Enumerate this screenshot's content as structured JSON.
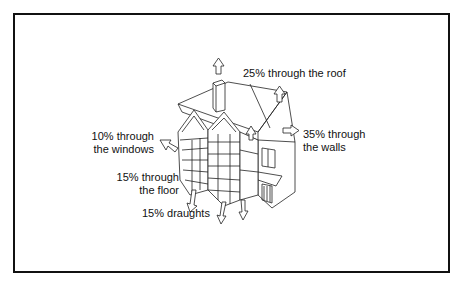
{
  "diagram": {
    "labels": {
      "roof": {
        "line1": "25% through the roof"
      },
      "walls": {
        "line1": "35% through",
        "line2": "the walls"
      },
      "windows": {
        "line1": "10% through",
        "line2": "the windows"
      },
      "floor": {
        "line1": "15% through",
        "line2": "the floor"
      },
      "draughts": {
        "line1": "15% draughts"
      }
    },
    "values": [
      {
        "source": "roof",
        "percent": 25
      },
      {
        "source": "walls",
        "percent": 35
      },
      {
        "source": "windows",
        "percent": 10
      },
      {
        "source": "floor",
        "percent": 15
      },
      {
        "source": "draughts",
        "percent": 15
      }
    ],
    "colors": {
      "line": "#111111",
      "background": "#ffffff"
    }
  }
}
